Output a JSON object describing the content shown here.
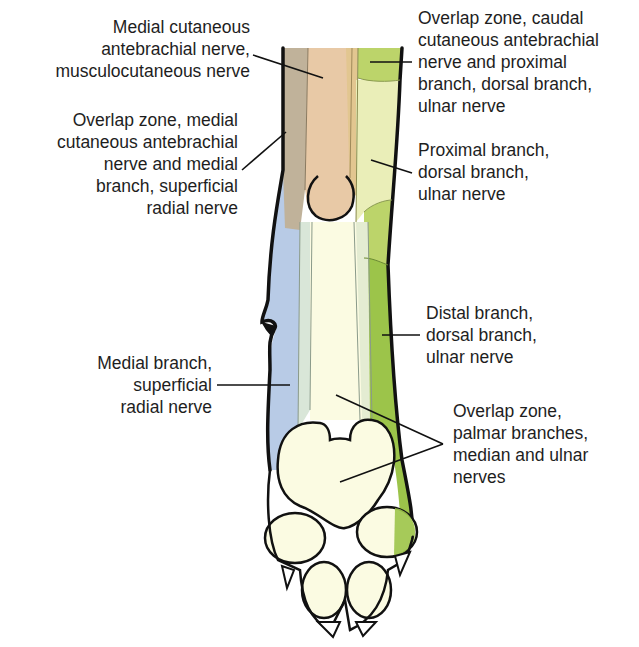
{
  "figure": {
    "colors": {
      "musculocutaneous": "#e8c9a6",
      "overlap_medial": "#c0b29a",
      "superficial_radial": "#b8cbe6",
      "ulnar_proximal": "#eaeeb8",
      "ulnar_overlap_top": "#bcd46a",
      "ulnar_distal": "#9cc44a",
      "palmar_overlap": "#fbfbe2",
      "bone_strip": "#d9e6d8",
      "outline": "#111111"
    }
  },
  "labels": {
    "medial_cutaneous": "Medial cutaneous\nantebrachial nerve,\nmusculocutaneous nerve",
    "overlap_medial": "Overlap zone, medial\ncutaneous antebrachial\nnerve and medial\nbranch, superficial\nradial nerve",
    "medial_branch": "Medial branch,\nsuperficial\nradial nerve",
    "overlap_caudal": "Overlap zone, caudal\ncutaneous antebrachial\nnerve and proximal\nbranch, dorsal branch,\nulnar nerve",
    "proximal_branch": "Proximal branch,\ndorsal branch,\nulnar nerve",
    "distal_branch": "Distal branch,\ndorsal branch,\nulnar nerve",
    "overlap_palmar": "Overlap zone,\npalmar branches,\nmedian and ulnar\nnerves"
  }
}
